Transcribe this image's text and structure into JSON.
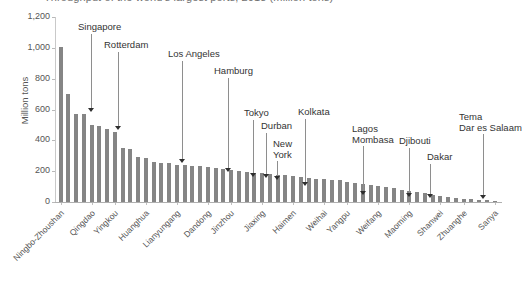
{
  "chart_data": {
    "type": "bar",
    "title": "Throughput of the world's largest ports, 2018 (million tons)",
    "xlabel": "",
    "ylabel": "Million tons",
    "ylim": [
      0,
      1200
    ],
    "yticks": [
      0,
      200,
      400,
      600,
      800,
      1000,
      1200
    ],
    "ytick_labels": [
      "0",
      "200",
      "400",
      "600",
      "800",
      "1,000",
      "1,200"
    ],
    "grid": false,
    "legend": "none",
    "categories": [
      "Ningbo-Zhoushan",
      "Shanghai",
      "Singapore",
      "Suzhou",
      "Guangzhou",
      "Qingdao",
      "Tianjin",
      "Rotterdam",
      "Port Hedland",
      "Busan",
      "Dalian",
      "Hong Kong",
      "Yingkou",
      "Qinhuangdao",
      "Rizhao",
      "Antwerp",
      "Yantai",
      "Huanghua",
      "Tangshan",
      "Fuzhou",
      "Lianyungang",
      "Zhanjiang",
      "Xiamen",
      "Nantong",
      "Dandong",
      "Zhenjiang",
      "Taizhou",
      "Jinzhou",
      "Quanzhou",
      "Beihai",
      "Jiaxing",
      "Yangzhou",
      "Wenzhou",
      "Haimen",
      "Shantou",
      "Los Angeles",
      "Weihai",
      "Zhuhai",
      "Hamburg",
      "Yangpu",
      "Fangchenggang",
      "Weifang",
      "Tokyo",
      "Durban",
      "New York",
      "Maoming",
      "Kolkata",
      "Basuo",
      "Shanwei",
      "Lagos",
      "Mombasa",
      "Zhuanghe",
      "Djibouti",
      "Dakar",
      "Sanya",
      "Tema",
      "Dar es Salaam"
    ],
    "values": [
      1008,
      700,
      570,
      568,
      500,
      492,
      472,
      452,
      352,
      345,
      292,
      286,
      258,
      252,
      250,
      243,
      240,
      236,
      232,
      228,
      222,
      216,
      208,
      200,
      196,
      190,
      186,
      182,
      178,
      172,
      168,
      162,
      158,
      152,
      148,
      144,
      140,
      132,
      124,
      116,
      110,
      104,
      96,
      88,
      80,
      72,
      64,
      56,
      48,
      40,
      34,
      28,
      22,
      18,
      14,
      10,
      7
    ],
    "xtick_labels": [
      "Ningbo-Zhoushan",
      "Qingdao",
      "Yingkou",
      "Huanghua",
      "Lianyungang",
      "Dandong",
      "Jinzhou",
      "Jiaxing",
      "Haimen",
      "Weihai",
      "Yangpu",
      "Weifang",
      "Maoming",
      "Shanwei",
      "Zhuanghe",
      "Sanya"
    ],
    "annotations": [
      {
        "label": "Singapore",
        "lines": [
          "Singapore"
        ]
      },
      {
        "label": "Rotterdam",
        "lines": [
          "Rotterdam"
        ]
      },
      {
        "label": "Los Angeles",
        "lines": [
          "Los Angeles"
        ]
      },
      {
        "label": "Hamburg",
        "lines": [
          "Hamburg"
        ]
      },
      {
        "label": "Tokyo",
        "lines": [
          "Tokyo"
        ]
      },
      {
        "label": "Durban",
        "lines": [
          "Durban"
        ]
      },
      {
        "label": "New York",
        "lines": [
          "New",
          "York"
        ]
      },
      {
        "label": "Kolkata",
        "lines": [
          "Kolkata"
        ]
      },
      {
        "label": "Lagos Mombasa",
        "lines": [
          "Lagos",
          "Mombasa"
        ]
      },
      {
        "label": "Djibouti",
        "lines": [
          "Djibouti"
        ]
      },
      {
        "label": "Dakar",
        "lines": [
          "Dakar"
        ]
      },
      {
        "label": "Tema Dar es Salaam",
        "lines": [
          "Tema",
          "Dar es Salaam"
        ]
      }
    ],
    "colors": {
      "bar": "#858585",
      "axis": "#b0b0b0",
      "text": "#555555",
      "annotation_text": "#333333",
      "annotation_line": "#8e8e8e",
      "annotation_head": "#2e2e2e",
      "background": "#ffffff"
    }
  }
}
